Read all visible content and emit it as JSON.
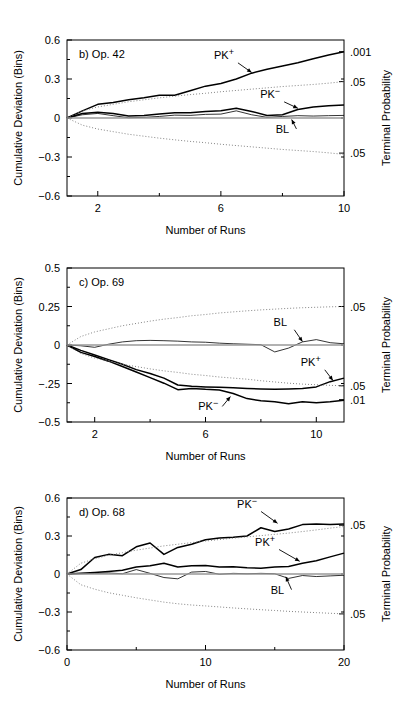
{
  "figure": {
    "background": "#ffffff",
    "line_color": "#000000",
    "dotted_color": "#777777",
    "width": 403,
    "height": 706
  },
  "common": {
    "xlabel": "Number of Runs",
    "ylabel_left": "Cumulative Deviation (Bins)",
    "ylabel_right": "Terminal Probability",
    "series_names": [
      "PK+",
      "PK-",
      "BL"
    ]
  },
  "chart_data": [
    {
      "type": "line",
      "panel": "b",
      "title": "b) Op. 42",
      "xlabel": "Number of Runs",
      "ylabel": "Cumulative Deviation (Bins)",
      "ylabel_right": "Terminal Probability",
      "xlim": [
        1,
        10
      ],
      "ylim": [
        -0.6,
        0.6
      ],
      "xticks": [
        2,
        6,
        10
      ],
      "xticks_minor": [
        4,
        8
      ],
      "xtick_labels": [
        "2",
        "6",
        "10"
      ],
      "yticks": [
        -0.6,
        -0.3,
        0,
        0.3,
        0.6
      ],
      "ytick_labels": [
        "-0.6",
        "-0.3",
        "0",
        "0.3",
        "0.6"
      ],
      "right_ticks": [
        {
          "value": 0.51,
          "label": ".001"
        },
        {
          "value": 0.28,
          "label": ".05"
        },
        {
          "value": -0.27,
          "label": ".05"
        }
      ],
      "x": [
        1,
        1.5,
        2,
        2.5,
        3,
        3.5,
        4,
        4.5,
        5,
        5.5,
        6,
        6.5,
        7,
        7.5,
        8,
        8.5,
        9,
        9.5,
        10
      ],
      "series": [
        {
          "name": "PK+",
          "style": "solid",
          "values": [
            0,
            0.055,
            0.105,
            0.12,
            0.14,
            0.155,
            0.175,
            0.175,
            0.21,
            0.245,
            0.265,
            0.3,
            0.345,
            0.375,
            0.4,
            0.425,
            0.455,
            0.485,
            0.51
          ],
          "label_pos": {
            "x": 6.1,
            "y": 0.455
          },
          "arrow_to": {
            "x": 7.0,
            "y": 0.35
          }
        },
        {
          "name": "PK-",
          "style": "solid",
          "values": [
            0,
            0.035,
            0.045,
            0.035,
            0.015,
            0.02,
            0.03,
            0.04,
            0.04,
            0.05,
            0.055,
            0.075,
            0.05,
            0.02,
            0.025,
            0.065,
            0.085,
            0.095,
            0.1
          ],
          "label_pos": {
            "x": 7.6,
            "y": 0.155
          },
          "arrow_to": {
            "x": 8.5,
            "y": 0.075
          }
        },
        {
          "name": "BL",
          "style": "solid-thin",
          "values": [
            0,
            0.025,
            0.035,
            0.018,
            0.002,
            0.005,
            0.012,
            0.022,
            0.02,
            0.028,
            0.03,
            0.055,
            0.025,
            0.005,
            0.012,
            0.018,
            0.015,
            0.018,
            0.02
          ],
          "label_pos": {
            "x": 8.0,
            "y": -0.115
          },
          "arrow_to": {
            "x": 8.3,
            "y": -0.012
          }
        },
        {
          "name": "zero-line",
          "style": "thin-gray",
          "values": [
            0,
            0,
            0,
            0,
            0,
            0,
            0,
            0,
            0,
            0,
            0,
            0,
            0,
            0,
            0,
            0,
            0,
            0,
            0
          ]
        },
        {
          "name": "upper-envelope",
          "style": "dotted",
          "values": [
            0,
            0.055,
            0.085,
            0.105,
            0.125,
            0.14,
            0.155,
            0.168,
            0.18,
            0.19,
            0.202,
            0.212,
            0.222,
            0.232,
            0.242,
            0.25,
            0.258,
            0.268,
            0.28
          ]
        },
        {
          "name": "lower-envelope",
          "style": "dotted",
          "values": [
            0,
            -0.055,
            -0.085,
            -0.105,
            -0.125,
            -0.14,
            -0.155,
            -0.168,
            -0.18,
            -0.19,
            -0.202,
            -0.212,
            -0.222,
            -0.232,
            -0.242,
            -0.25,
            -0.258,
            -0.268,
            -0.28
          ]
        }
      ]
    },
    {
      "type": "line",
      "panel": "c",
      "title": "c) Op. 69",
      "xlabel": "Number of Runs",
      "ylabel": "Cumulative Deviation (Bins)",
      "ylabel_right": "Terminal Probability",
      "xlim": [
        1,
        11
      ],
      "ylim": [
        -0.5,
        0.5
      ],
      "xticks": [
        2,
        6,
        10
      ],
      "xticks_minor": [
        4,
        8
      ],
      "xtick_labels": [
        "2",
        "6",
        "10"
      ],
      "yticks": [
        -0.5,
        -0.25,
        0,
        0.25,
        0.5
      ],
      "ytick_labels": [
        "-0.5",
        "-.25",
        "0",
        "0.25",
        "0.5"
      ],
      "right_ticks": [
        {
          "value": 0.25,
          "label": ".05"
        },
        {
          "value": -0.265,
          "label": ".05"
        },
        {
          "value": -0.355,
          "label": ".01"
        }
      ],
      "x": [
        1,
        1.5,
        2,
        2.5,
        3,
        3.5,
        4,
        4.5,
        5,
        5.5,
        6,
        6.5,
        7,
        7.5,
        8,
        8.5,
        9,
        9.5,
        10,
        10.5,
        11
      ],
      "series": [
        {
          "name": "BL",
          "style": "solid-thin",
          "values": [
            0,
            -0.005,
            -0.015,
            0.005,
            0.02,
            0.028,
            0.03,
            0.028,
            0.025,
            0.02,
            0.018,
            0.012,
            0.008,
            0.005,
            0.002,
            -0.045,
            -0.02,
            0.02,
            0.035,
            0.015,
            0.008
          ],
          "label_pos": {
            "x": 8.7,
            "y": 0.125
          },
          "arrow_to": {
            "x": 9.5,
            "y": 0.022
          }
        },
        {
          "name": "PK+",
          "style": "solid",
          "values": [
            0,
            -0.035,
            -0.065,
            -0.095,
            -0.125,
            -0.16,
            -0.185,
            -0.215,
            -0.26,
            -0.268,
            -0.272,
            -0.275,
            -0.278,
            -0.282,
            -0.285,
            -0.288,
            -0.285,
            -0.282,
            -0.272,
            -0.238,
            -0.215
          ],
          "label_pos": {
            "x": 9.8,
            "y": -0.135
          },
          "arrow_to": {
            "x": 10.6,
            "y": -0.23
          }
        },
        {
          "name": "PK-",
          "style": "solid",
          "values": [
            0,
            -0.048,
            -0.075,
            -0.105,
            -0.14,
            -0.175,
            -0.212,
            -0.248,
            -0.29,
            -0.282,
            -0.288,
            -0.292,
            -0.315,
            -0.348,
            -0.362,
            -0.368,
            -0.382,
            -0.368,
            -0.375,
            -0.368,
            -0.358
          ],
          "label_pos": {
            "x": 6.1,
            "y": -0.425
          },
          "arrow_to": {
            "x": 6.9,
            "y": -0.335
          }
        },
        {
          "name": "zero-line",
          "style": "thin-gray",
          "values": [
            0,
            0,
            0,
            0,
            0,
            0,
            0,
            0,
            0,
            0,
            0,
            0,
            0,
            0,
            0,
            0,
            0,
            0,
            0,
            0,
            0
          ]
        },
        {
          "name": "upper-envelope",
          "style": "dotted",
          "values": [
            0,
            0.055,
            0.085,
            0.105,
            0.125,
            0.14,
            0.155,
            0.168,
            0.178,
            0.19,
            0.198,
            0.208,
            0.215,
            0.222,
            0.228,
            0.233,
            0.238,
            0.242,
            0.245,
            0.248,
            0.25
          ]
        },
        {
          "name": "lower-envelope",
          "style": "dotted",
          "values": [
            0,
            -0.055,
            -0.085,
            -0.105,
            -0.125,
            -0.14,
            -0.155,
            -0.168,
            -0.178,
            -0.19,
            -0.198,
            -0.208,
            -0.215,
            -0.222,
            -0.232,
            -0.24,
            -0.248,
            -0.254,
            -0.258,
            -0.262,
            -0.265
          ]
        }
      ]
    },
    {
      "type": "line",
      "panel": "d",
      "title": "d) Op. 68",
      "xlabel": "Number of Runs",
      "ylabel": "Cumulative Deviation (Bins)",
      "ylabel_right": "Terminal Probability",
      "xlim": [
        0,
        20
      ],
      "ylim": [
        -0.6,
        0.6
      ],
      "xticks": [
        0,
        10,
        20
      ],
      "xticks_minor": [
        5,
        15
      ],
      "xtick_labels": [
        "0",
        "10",
        "20"
      ],
      "yticks": [
        -0.6,
        -0.3,
        0,
        0.3,
        0.6
      ],
      "ytick_labels": [
        "-0.6",
        "-0.3",
        "0",
        "0.3",
        "0.6"
      ],
      "right_ticks": [
        {
          "value": 0.385,
          "label": ".05"
        },
        {
          "value": -0.315,
          "label": ".05"
        }
      ],
      "x": [
        0,
        1,
        2,
        3,
        4,
        5,
        6,
        7,
        8,
        9,
        10,
        11,
        12,
        13,
        14,
        15,
        16,
        17,
        18,
        19,
        20
      ],
      "series": [
        {
          "name": "PK-",
          "style": "solid",
          "values": [
            0,
            0.035,
            0.13,
            0.155,
            0.145,
            0.215,
            0.245,
            0.155,
            0.21,
            0.235,
            0.27,
            0.285,
            0.29,
            0.3,
            0.365,
            0.335,
            0.355,
            0.39,
            0.395,
            0.39,
            0.395
          ],
          "label_pos": {
            "x": 13.0,
            "y": 0.525
          },
          "arrow_to": {
            "x": 15.2,
            "y": 0.4
          }
        },
        {
          "name": "PK+",
          "style": "solid",
          "values": [
            0,
            0.005,
            0.012,
            0.02,
            0.03,
            0.055,
            0.065,
            0.085,
            0.055,
            0.065,
            0.068,
            0.055,
            0.058,
            0.05,
            0.045,
            0.055,
            0.06,
            0.085,
            0.105,
            0.135,
            0.165
          ],
          "label_pos": {
            "x": 14.3,
            "y": 0.225
          },
          "arrow_to": {
            "x": 16.8,
            "y": 0.1
          }
        },
        {
          "name": "BL",
          "style": "solid-thin",
          "values": [
            0,
            0.002,
            0.005,
            0.008,
            0.002,
            0.035,
            0.005,
            -0.028,
            -0.038,
            0.015,
            0.02,
            -0.002,
            0.005,
            0.002,
            0.005,
            0.002,
            -0.035,
            -0.012,
            -0.02,
            -0.015,
            -0.01
          ],
          "label_pos": {
            "x": 15.2,
            "y": -0.155
          },
          "arrow_to": {
            "x": 15.8,
            "y": -0.022
          }
        },
        {
          "name": "zero-line",
          "style": "thin-gray",
          "values": [
            0,
            0,
            0,
            0,
            0,
            0,
            0,
            0,
            0,
            0,
            0,
            0,
            0,
            0,
            0,
            0,
            0,
            0,
            0,
            0,
            0
          ]
        },
        {
          "name": "upper-envelope",
          "style": "dotted",
          "values": [
            0,
            0.085,
            0.12,
            0.148,
            0.168,
            0.188,
            0.205,
            0.222,
            0.235,
            0.248,
            0.26,
            0.272,
            0.283,
            0.293,
            0.303,
            0.313,
            0.323,
            0.335,
            0.348,
            0.362,
            0.375
          ]
        },
        {
          "name": "lower-envelope",
          "style": "dotted",
          "values": [
            0,
            -0.085,
            -0.12,
            -0.148,
            -0.168,
            -0.188,
            -0.205,
            -0.222,
            -0.235,
            -0.245,
            -0.252,
            -0.26,
            -0.268,
            -0.275,
            -0.282,
            -0.288,
            -0.295,
            -0.3,
            -0.305,
            -0.31,
            -0.315
          ]
        }
      ]
    }
  ]
}
